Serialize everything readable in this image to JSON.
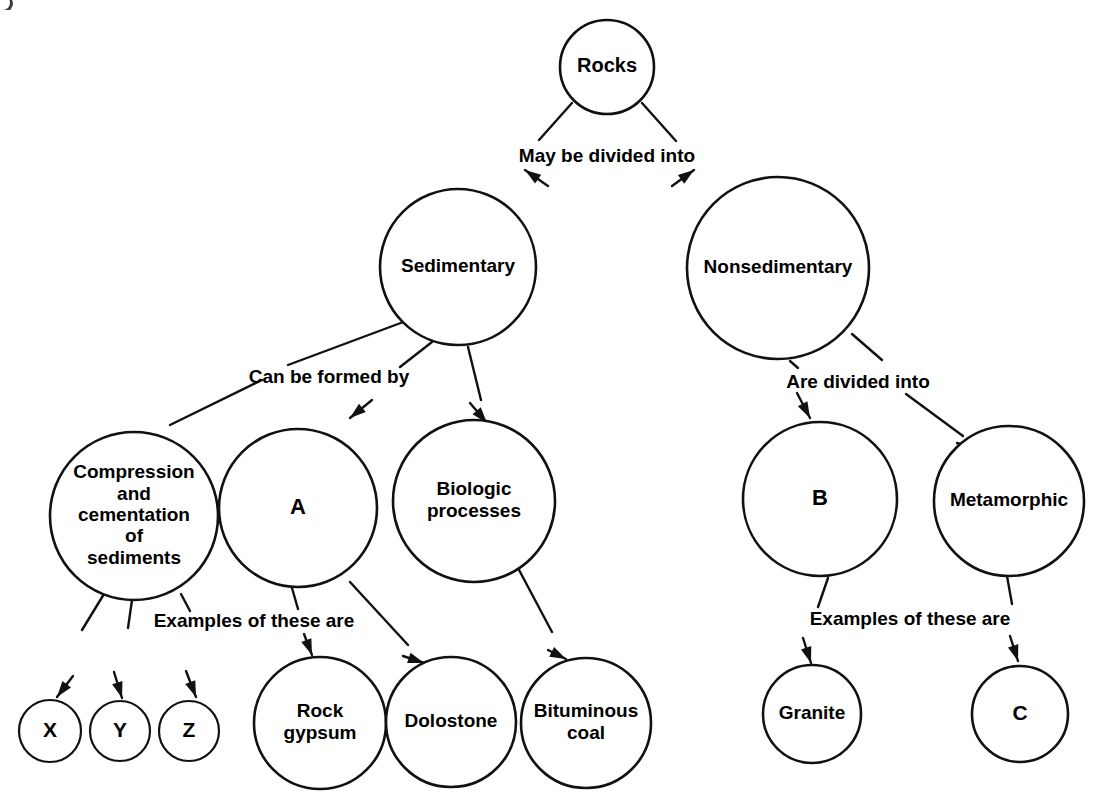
{
  "diagram": {
    "background_color": "#ffffff",
    "stroke_color": "#111111",
    "text_color": "#000000",
    "nodes": [
      {
        "id": "rocks",
        "label": "Rocks",
        "lines": [
          "Rocks"
        ],
        "cx": 607,
        "cy": 67,
        "r": 47,
        "font_size": 20
      },
      {
        "id": "sedimentary",
        "label": "Sedimentary",
        "lines": [
          "Sedimentary"
        ],
        "cx": 458,
        "cy": 267,
        "r": 78,
        "font_size": 19
      },
      {
        "id": "nonsedimentary",
        "label": "Nonsedimentary",
        "lines": [
          "Nonsedimentary"
        ],
        "cx": 778,
        "cy": 268,
        "r": 91,
        "font_size": 19
      },
      {
        "id": "compression",
        "label": "Compression and cementation of sediments",
        "lines": [
          "Compression",
          "and",
          "cementation",
          "of",
          "sediments"
        ],
        "cx": 134,
        "cy": 516,
        "r": 84,
        "font_size": 19
      },
      {
        "id": "a",
        "label": "A",
        "lines": [
          "A"
        ],
        "cx": 298,
        "cy": 508,
        "r": 79,
        "font_size": 22
      },
      {
        "id": "biologic",
        "label": "Biologic processes",
        "lines": [
          "Biologic",
          "processes"
        ],
        "cx": 474,
        "cy": 501,
        "r": 81,
        "font_size": 19
      },
      {
        "id": "b",
        "label": "B",
        "lines": [
          "B"
        ],
        "cx": 820,
        "cy": 499,
        "r": 77,
        "font_size": 22
      },
      {
        "id": "metamorphic",
        "label": "Metamorphic",
        "lines": [
          "Metamorphic"
        ],
        "cx": 1009,
        "cy": 501,
        "r": 75,
        "font_size": 19
      },
      {
        "id": "x",
        "label": "X",
        "lines": [
          "X"
        ],
        "cx": 50,
        "cy": 731,
        "r": 31,
        "font_size": 21
      },
      {
        "id": "y",
        "label": "Y",
        "lines": [
          "Y"
        ],
        "cx": 120,
        "cy": 731,
        "r": 30,
        "font_size": 21
      },
      {
        "id": "z",
        "label": "Z",
        "lines": [
          "Z"
        ],
        "cx": 189,
        "cy": 731,
        "r": 30,
        "font_size": 21
      },
      {
        "id": "rockgypsum",
        "label": "Rock gypsum",
        "lines": [
          "Rock",
          "gypsum"
        ],
        "cx": 320,
        "cy": 723,
        "r": 66,
        "font_size": 19
      },
      {
        "id": "dolostone",
        "label": "Dolostone",
        "lines": [
          "Dolostone"
        ],
        "cx": 451,
        "cy": 722,
        "r": 65,
        "font_size": 19
      },
      {
        "id": "bituminous",
        "label": "Bituminous coal",
        "lines": [
          "Bituminous",
          "coal"
        ],
        "cx": 586,
        "cy": 723,
        "r": 65,
        "font_size": 19
      },
      {
        "id": "granite",
        "label": "Granite",
        "lines": [
          "Granite"
        ],
        "cx": 812,
        "cy": 714,
        "r": 49,
        "font_size": 19
      },
      {
        "id": "c",
        "label": "C",
        "lines": [
          "C"
        ],
        "cx": 1020,
        "cy": 714,
        "r": 48,
        "font_size": 21
      }
    ],
    "edge_labels": [
      {
        "id": "may-be-divided-into",
        "text": "May be divided into",
        "x": 607,
        "y": 157,
        "font_size": 19
      },
      {
        "id": "can-be-formed-by",
        "text": "Can be formed by",
        "x": 329,
        "y": 378,
        "font_size": 19
      },
      {
        "id": "are-divided-into",
        "text": "Are divided into",
        "x": 858,
        "y": 383,
        "font_size": 19
      },
      {
        "id": "examples-of-these-are-left",
        "text": "Examples of these are",
        "x": 254,
        "y": 622,
        "font_size": 19
      },
      {
        "id": "examples-of-these-are-right",
        "text": "Examples of these are",
        "x": 910,
        "y": 620,
        "font_size": 19
      }
    ],
    "edges": [
      {
        "id": "rocks-to-sedimentary",
        "from": "rocks",
        "to": "sedimentary",
        "label": "May be divided into"
      },
      {
        "id": "rocks-to-nonsedimentary",
        "from": "rocks",
        "to": "nonsedimentary",
        "label": "May be divided into"
      },
      {
        "id": "sedimentary-to-compression",
        "from": "sedimentary",
        "to": "compression",
        "label": "Can be formed by"
      },
      {
        "id": "sedimentary-to-a",
        "from": "sedimentary",
        "to": "a",
        "label": "Can be formed by"
      },
      {
        "id": "sedimentary-to-biologic",
        "from": "sedimentary",
        "to": "biologic",
        "label": "Can be formed by"
      },
      {
        "id": "nonsedimentary-to-b",
        "from": "nonsedimentary",
        "to": "b",
        "label": "Are divided into"
      },
      {
        "id": "nonsedimentary-to-metamorphic",
        "from": "nonsedimentary",
        "to": "metamorphic",
        "label": "Are divided into"
      },
      {
        "id": "compression-to-x",
        "from": "compression",
        "to": "x",
        "label": "Examples of these are"
      },
      {
        "id": "compression-to-y",
        "from": "compression",
        "to": "y",
        "label": "Examples of these are"
      },
      {
        "id": "compression-to-z",
        "from": "compression",
        "to": "z",
        "label": "Examples of these are"
      },
      {
        "id": "a-to-rockgypsum",
        "from": "a",
        "to": "rockgypsum",
        "label": "Examples of these are"
      },
      {
        "id": "a-to-dolostone",
        "from": "a",
        "to": "dolostone",
        "label": "Examples of these are"
      },
      {
        "id": "biologic-to-bituminous",
        "from": "biologic",
        "to": "bituminous",
        "label": "Examples of these are"
      },
      {
        "id": "b-to-granite",
        "from": "b",
        "to": "granite",
        "label": "Examples of these are"
      },
      {
        "id": "metamorphic-to-c",
        "from": "metamorphic",
        "to": "c",
        "label": "Examples of these are"
      }
    ],
    "edge_geometry": [
      {
        "id": "rocks-to-sedimentary",
        "segments": [
          [
            572,
            103,
            539,
            140
          ]
        ],
        "arrow": [
          525,
          170,
          548,
          186
        ]
      },
      {
        "id": "rocks-to-nonsedimentary",
        "segments": [
          [
            642,
            103,
            676,
            141
          ]
        ],
        "arrow": [
          694,
          170,
          672,
          186
        ]
      },
      {
        "id": "sedimentary-to-compression",
        "segments": [
          [
            406,
            321,
            288,
            365
          ],
          [
            262,
            380,
            170,
            425
          ]
        ],
        "arrow": [
          150,
          435,
          175,
          449
        ]
      },
      {
        "id": "sedimentary-to-a",
        "segments": [
          [
            432,
            342,
            400,
            367
          ]
        ],
        "arrow": [
          350,
          418,
          372,
          400
        ]
      },
      {
        "id": "sedimentary-to-biologic",
        "segments": [
          [
            468,
            347,
            481,
            400
          ]
        ],
        "arrow": [
          487,
          423,
          470,
          403
        ]
      },
      {
        "id": "nonsedimentary-to-b",
        "segments": [
          [
            790,
            361,
            798,
            368
          ]
        ],
        "arrow": [
          810,
          418,
          797,
          393
        ]
      },
      {
        "id": "nonsedimentary-to-metamorphic",
        "segments": [
          [
            852,
            334,
            882,
            360
          ],
          [
            906,
            394,
            963,
            436
          ]
        ],
        "arrow": [
          980,
          450,
          957,
          443
        ]
      },
      {
        "id": "compression-to-x",
        "segments": [
          [
            104,
            594,
            82,
            630
          ]
        ],
        "arrow": [
          57,
          697,
          73,
          676
        ]
      },
      {
        "id": "compression-to-y",
        "segments": [
          [
            132,
            600,
            128,
            628
          ]
        ],
        "arrow": [
          122,
          698,
          114,
          672
        ]
      },
      {
        "id": "compression-to-z",
        "segments": [
          [
            181,
            594,
            190,
            611
          ]
        ],
        "arrow": [
          196,
          697,
          186,
          671
        ]
      },
      {
        "id": "a-to-rockgypsum",
        "segments": [
          [
            292,
            588,
            298,
            609
          ]
        ],
        "arrow": [
          312,
          655,
          304,
          634
        ]
      },
      {
        "id": "a-to-dolostone",
        "segments": [
          [
            350,
            582,
            408,
            645
          ]
        ],
        "arrow": [
          424,
          663,
          403,
          656
        ]
      },
      {
        "id": "biologic-to-bituminous",
        "segments": [
          [
            518,
            568,
            552,
            632
          ]
        ],
        "arrow": [
          566,
          659,
          548,
          650
        ]
      },
      {
        "id": "b-to-granite",
        "segments": [
          [
            828,
            578,
            818,
            607
          ]
        ],
        "arrow": [
          811,
          663,
          803,
          638
        ]
      },
      {
        "id": "metamorphic-to-c",
        "segments": [
          [
            1007,
            576,
            1012,
            604
          ]
        ],
        "arrow": [
          1018,
          661,
          1010,
          636
        ]
      }
    ]
  }
}
